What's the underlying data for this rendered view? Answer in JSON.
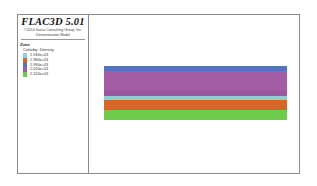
{
  "legend": {
    "title": "FLAC3D 5.01",
    "copyright": "©2014 Itasca Consulting Group, Inc.",
    "model_name": "Demonstration Model",
    "section": "Zone",
    "color_by": "Colorby: Density",
    "items": [
      {
        "label": "1.940e+03",
        "color": "#8fd0dc"
      },
      {
        "label": "1.980e+03",
        "color": "#d9642a"
      },
      {
        "label": "1.990e+03",
        "color": "#4f74c4"
      },
      {
        "label": "2.010e+03",
        "color": "#a45da4"
      },
      {
        "label": "2.120e+03",
        "color": "#6ecb4b"
      }
    ]
  },
  "model": {
    "bands": [
      {
        "name": "blue-layer",
        "color": "#4f74c4",
        "height": 5
      },
      {
        "name": "purple-layer",
        "color": "#a45da4",
        "height": 20
      },
      {
        "name": "purple-dark-layer",
        "color": "#9a58a0",
        "height": 5
      },
      {
        "name": "cyan-layer",
        "color": "#8fcfd0",
        "height": 4
      },
      {
        "name": "orange-layer",
        "color": "#d9642a",
        "height": 10
      },
      {
        "name": "green-layer",
        "color": "#6ecb4b",
        "height": 10
      }
    ]
  }
}
